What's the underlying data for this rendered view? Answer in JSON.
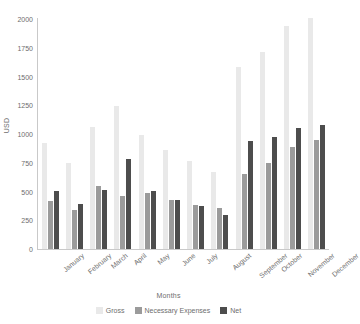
{
  "chart_data": {
    "type": "bar",
    "title": "",
    "subtitle": "",
    "xlabel": "Months",
    "ylabel": "USD",
    "ylim": [
      0,
      2000
    ],
    "yticks": [
      0,
      250,
      500,
      750,
      1000,
      1250,
      1500,
      1750,
      2000
    ],
    "grid": false,
    "legend_position": "bottom",
    "categories": [
      "January",
      "February",
      "March",
      "April",
      "May",
      "June",
      "July",
      "August",
      "September",
      "October",
      "November",
      "December"
    ],
    "series": [
      {
        "name": "Gross",
        "color": "#e9e9e9",
        "values": [
          920,
          745,
          1065,
          1240,
          995,
          860,
          765,
          670,
          1585,
          1715,
          1935,
          2010
        ]
      },
      {
        "name": "Necessary Expenses",
        "color": "#9b9b9b",
        "values": [
          415,
          340,
          550,
          460,
          490,
          430,
          380,
          355,
          650,
          745,
          885,
          945
        ]
      },
      {
        "name": "Net",
        "color": "#4d4d4d",
        "values": [
          505,
          390,
          515,
          780,
          505,
          425,
          375,
          300,
          940,
          975,
          1050,
          1075
        ]
      }
    ]
  },
  "axes": {
    "y_title": "USD",
    "x_title": "Months",
    "y_tick_labels": [
      "0",
      "250",
      "500",
      "750",
      "1000",
      "1250",
      "1500",
      "1750",
      "2000"
    ]
  },
  "legend": {
    "items": [
      {
        "label": "Gross",
        "color": "#e9e9e9"
      },
      {
        "label": "Necessary Expenses",
        "color": "#9b9b9b"
      },
      {
        "label": "Net",
        "color": "#4d4d4d"
      }
    ]
  }
}
